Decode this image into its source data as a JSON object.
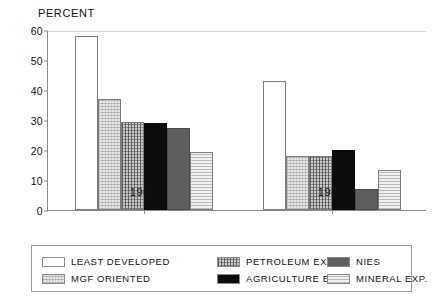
{
  "chart_data": {
    "type": "bar",
    "title": "PERCENT",
    "xlabel": "",
    "ylabel": "PERCENT",
    "ylim": [
      0,
      60
    ],
    "yticks": [
      0,
      10,
      20,
      30,
      40,
      50,
      60
    ],
    "grid": false,
    "legend_position": "bottom",
    "categories": [
      "1960",
      "1987"
    ],
    "series": [
      {
        "name": "LEAST DEVELOPED",
        "values": [
          58,
          43
        ],
        "swatch": "white",
        "color": "#ffffff"
      },
      {
        "name": "MGF ORIENTED",
        "values": [
          37,
          18
        ],
        "swatch": "light-dotted",
        "color": "#e6e6e6"
      },
      {
        "name": "PETROLEUM EXP.",
        "values": [
          29.5,
          18
        ],
        "swatch": "dark-crosshatch",
        "color": "#c9c9c9"
      },
      {
        "name": "AGRICULTURE EXP.",
        "values": [
          29,
          20
        ],
        "swatch": "black",
        "color": "#0c0c0c"
      },
      {
        "name": "NIES",
        "values": [
          27.5,
          7
        ],
        "swatch": "medium-gray",
        "color": "#5e5e5e"
      },
      {
        "name": "MINERAL EXP.",
        "values": [
          19.5,
          13.5
        ],
        "swatch": "light-horizontal",
        "color": "#f0f0f0"
      }
    ]
  },
  "legend": {
    "items": [
      {
        "label": "LEAST DEVELOPED"
      },
      {
        "label": "MGF ORIENTED"
      },
      {
        "label": "PETROLEUM EXP."
      },
      {
        "label": "AGRICULTURE EXP."
      },
      {
        "label": "NIES"
      },
      {
        "label": "MINERAL EXP."
      }
    ]
  }
}
